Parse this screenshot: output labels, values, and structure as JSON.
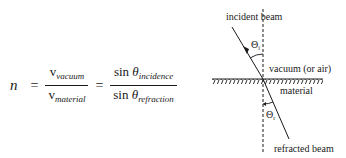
{
  "equation": {
    "lhs": "n",
    "equals": "=",
    "fraction1": {
      "numerator": {
        "base": "v",
        "subscript": "vacuum"
      },
      "denominator": {
        "base": "v",
        "subscript": "material"
      }
    },
    "fraction2": {
      "numerator": {
        "func": "sin",
        "symbol": "θ",
        "subscript": "incidence"
      },
      "denominator": {
        "func": "sin",
        "symbol": "θ",
        "subscript": "refraction"
      }
    }
  },
  "diagram": {
    "labels": {
      "incident_beam": "incident beam",
      "theta_i": "Θ",
      "theta_i_sub": "i",
      "upper_medium": "vacuum (or air)",
      "lower_medium": "material",
      "theta_r": "Θ",
      "theta_r_sub": "r",
      "refracted_beam": "refracted beam"
    },
    "colors": {
      "ink": "#1a1a1a",
      "background": "#ffffff"
    }
  }
}
